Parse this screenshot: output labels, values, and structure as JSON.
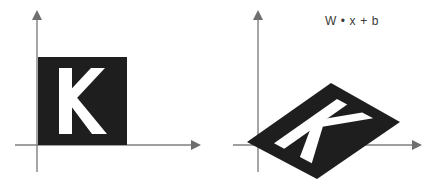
{
  "figure": {
    "width": 438,
    "height": 188,
    "background_color": "#ffffff"
  },
  "colors": {
    "axis": "#808080",
    "axis_arrow": "#6f6f6f",
    "shape_fill": "#1e1e1e",
    "letter_fill": "#ffffff",
    "label_text": "#3a3a3a"
  },
  "panels": [
    {
      "id": "source",
      "name": "input-panel",
      "label": "",
      "axes": {
        "x_axis": {
          "x1": 15,
          "y1": 145,
          "x2": 196,
          "y2": 145,
          "arrow": "right"
        },
        "y_axis": {
          "x1": 37,
          "y1": 172,
          "x2": 37,
          "y2": 15,
          "arrow": "up"
        },
        "origin": {
          "x": 37,
          "y": 145
        }
      },
      "shape": {
        "type": "square",
        "corners": [
          [
            38,
            57
          ],
          [
            127,
            57
          ],
          [
            127,
            145
          ],
          [
            38,
            145
          ]
        ],
        "fill": "#1e1e1e"
      },
      "letter": {
        "character": "K",
        "fill": "#ffffff",
        "center": {
          "x": 82,
          "y": 101
        },
        "font_size": 74
      }
    },
    {
      "id": "target",
      "name": "output-panel",
      "label": "W • x + b",
      "label_position": {
        "x": 325,
        "y": 14
      },
      "axes": {
        "x_axis": {
          "x1": 233,
          "y1": 145,
          "x2": 420,
          "y2": 145,
          "arrow": "right"
        },
        "y_axis": {
          "x1": 258,
          "y1": 172,
          "x2": 258,
          "y2": 15,
          "arrow": "up"
        },
        "origin": {
          "x": 258,
          "y": 145
        }
      },
      "shape": {
        "type": "parallelogram",
        "corners": [
          [
            247,
            142
          ],
          [
            331,
            83
          ],
          [
            400,
            122
          ],
          [
            317,
            179
          ]
        ],
        "fill": "#1e1e1e"
      },
      "letter": {
        "character": "K",
        "fill": "#ffffff",
        "center": {
          "x": 322,
          "y": 128
        },
        "font_size": 74,
        "rotation_deg": -31,
        "skew_x_deg": 22,
        "scale_y": 0.74
      }
    }
  ],
  "annotations": {
    "formula": "W • x + b",
    "formula_parts": [
      "W",
      "•",
      "x",
      "+",
      "b"
    ]
  }
}
